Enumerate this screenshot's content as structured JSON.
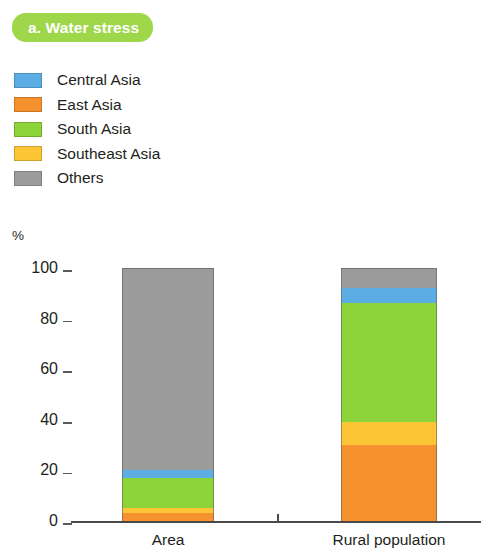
{
  "title": {
    "badge_text": "a. Water stress",
    "badge_color": "#9ed74a",
    "badge_text_color": "#ffffff"
  },
  "legend": {
    "items": [
      {
        "label": "Central Asia",
        "color": "#5badE4"
      },
      {
        "label": "East Asia",
        "color": "#f5912f"
      },
      {
        "label": "South Asia",
        "color": "#8dd33a"
      },
      {
        "label": "Southeast Asia",
        "color": "#fbc535"
      },
      {
        "label": "Others",
        "color": "#9b9b9b"
      }
    ]
  },
  "axis": {
    "unit_label": "%",
    "y_ticks": [
      "100",
      "80",
      "60",
      "40",
      "20",
      "0"
    ]
  },
  "chart_data": {
    "type": "bar",
    "title": "a. Water stress",
    "xlabel": "",
    "ylabel": "%",
    "ylim": [
      0,
      100
    ],
    "yticks": [
      0,
      20,
      40,
      60,
      80,
      100
    ],
    "grid": false,
    "stacked": true,
    "legend_position": "top-left",
    "categories": [
      "Area",
      "Rural population"
    ],
    "series": [
      {
        "name": "East Asia",
        "color": "#f5912f",
        "values": [
          3,
          30
        ]
      },
      {
        "name": "Southeast Asia",
        "color": "#fbc535",
        "values": [
          2,
          9
        ]
      },
      {
        "name": "South Asia",
        "color": "#8dd33a",
        "values": [
          12,
          47
        ]
      },
      {
        "name": "Central Asia",
        "color": "#5badE4",
        "values": [
          3,
          6
        ]
      },
      {
        "name": "Others",
        "color": "#9b9b9b",
        "values": [
          80,
          8
        ]
      }
    ]
  }
}
